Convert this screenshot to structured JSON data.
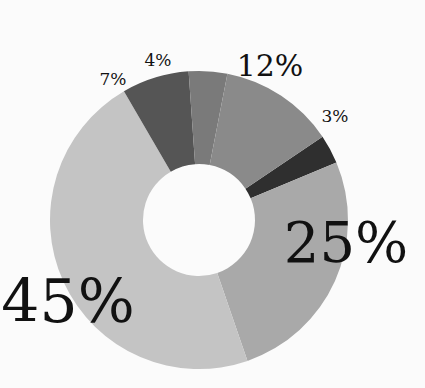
{
  "chart_data": {
    "type": "pie",
    "donut": true,
    "title": "",
    "categories": [
      "Slice 3%",
      "Slice 25%",
      "Slice 45%",
      "Slice 7%",
      "Slice 4%",
      "Slice 12%"
    ],
    "values": [
      3,
      25,
      45,
      7,
      4,
      12
    ],
    "labels": [
      "3%",
      "25%",
      "45%",
      "7%",
      "4%",
      "12%"
    ],
    "colors": [
      "#2f2f2f",
      "#a9a9a9",
      "#c4c4c4",
      "#555555",
      "#7a7a7a",
      "#8a8a8a"
    ],
    "label_sizes": [
      17,
      56,
      60,
      17,
      17,
      30
    ],
    "start_angle_deg": 56,
    "legend": "none",
    "center": [
      199,
      220
    ],
    "outer_radius": 149,
    "inner_radius": 56
  }
}
